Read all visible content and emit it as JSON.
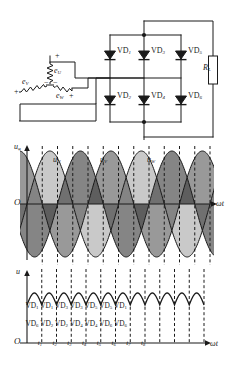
{
  "figure": {
    "type": "three-phase-bridge-rectifier-diagram",
    "colors": {
      "line": "#1a1a1a",
      "fill_light": "#a8a8a8",
      "fill_dark": "#5a5a5a",
      "fill_darkest": "#3a3a3a",
      "axis": "#1a1a1a",
      "dashed": "#1a1a1a",
      "background": "#ffffff"
    }
  },
  "circuit": {
    "name": "three-phase-bridge-rectifier",
    "source": {
      "label": "three-phase-y-source",
      "phases": [
        {
          "name": "phase-u",
          "label": "e",
          "sub": "U",
          "polarity_top": "+",
          "polarity_bottom": "−"
        },
        {
          "name": "phase-v",
          "label": "e",
          "sub": "V",
          "polarity_top": "+",
          "polarity_bottom": "−"
        },
        {
          "name": "phase-w",
          "label": "e",
          "sub": "W",
          "polarity_top": "+",
          "polarity_bottom": "−"
        }
      ]
    },
    "diodes_top": [
      {
        "label": "VD",
        "sub": "1"
      },
      {
        "label": "VD",
        "sub": "3"
      },
      {
        "label": "VD",
        "sub": "5"
      }
    ],
    "diodes_bottom": [
      {
        "label": "VD",
        "sub": "2"
      },
      {
        "label": "VD",
        "sub": "4"
      },
      {
        "label": "VD",
        "sub": "6"
      }
    ],
    "load": {
      "label": "R",
      "sub": "L"
    }
  },
  "chart_data": [
    {
      "type": "line",
      "name": "phase-voltage-waveforms",
      "title": "",
      "ylabel": "uφ",
      "ylabel_main": "u",
      "ylabel_sub": "φ",
      "xlabel": "ωt",
      "origin_label": "O",
      "grid": false,
      "legend_position": "inline-above-peaks",
      "x": [
        0,
        30,
        60,
        90,
        120,
        150,
        180,
        210,
        240,
        270,
        300,
        330,
        360,
        390,
        420,
        450,
        480,
        510,
        540,
        570,
        600,
        630,
        660,
        690,
        720
      ],
      "xlim": [
        0,
        720
      ],
      "ylim": [
        -1.15,
        1.15
      ],
      "series": [
        {
          "name": "u_U",
          "label": "u",
          "sub": "U",
          "phase_deg": 0,
          "values": [
            0,
            0.5,
            0.866,
            1,
            0.866,
            0.5,
            0,
            -0.5,
            -0.866,
            -1,
            -0.866,
            -0.5,
            0,
            0.5,
            0.866,
            1,
            0.866,
            0.5,
            0,
            -0.5,
            -0.866,
            -1,
            -0.866,
            -0.5,
            0
          ]
        },
        {
          "name": "u_V",
          "label": "u",
          "sub": "V",
          "phase_deg": -120,
          "values": [
            -0.866,
            -1,
            -0.866,
            -0.5,
            0,
            0.5,
            0.866,
            1,
            0.866,
            0.5,
            0,
            -0.5,
            -0.866,
            -1,
            -0.866,
            -0.5,
            0,
            0.5,
            0.866,
            1,
            0.866,
            0.5,
            0,
            -0.5,
            -0.866
          ]
        },
        {
          "name": "u_W",
          "label": "u",
          "sub": "W",
          "phase_deg": 120,
          "values": [
            0.866,
            0.5,
            0,
            -0.5,
            -0.866,
            -1,
            -0.866,
            -0.5,
            0,
            0.5,
            0.866,
            1,
            0.866,
            0.5,
            0,
            -0.5,
            -0.866,
            -1,
            -0.866,
            -0.5,
            0,
            0.5,
            0.866,
            1,
            0.866
          ]
        }
      ]
    },
    {
      "type": "line",
      "name": "rectified-output-voltage",
      "title": "",
      "ylabel": "u",
      "ylabel_main": "u",
      "ylabel_sub": "d",
      "xlabel": "ωt",
      "origin_label": "O",
      "grid": false,
      "description": "six-pulse rectified dc output with ripple",
      "xlim": [
        0,
        720
      ],
      "ylim": [
        0,
        1.15
      ],
      "ripple_min": 0.866,
      "ripple_max": 1.0,
      "pulses": 14,
      "time_markers": [
        {
          "label": "t",
          "sub": "1"
        },
        {
          "label": "t",
          "sub": "2"
        },
        {
          "label": "t",
          "sub": "3"
        },
        {
          "label": "t",
          "sub": "4"
        },
        {
          "label": "t",
          "sub": "5"
        },
        {
          "label": "t",
          "sub": "6"
        },
        {
          "label": "t",
          "sub": "7"
        },
        {
          "label": "t",
          "sub": "8"
        }
      ],
      "conduction_top": [
        {
          "label": "VD",
          "sub": "1"
        },
        {
          "label": "VD",
          "sub": "1"
        },
        {
          "label": "VD",
          "sub": "3"
        },
        {
          "label": "VD",
          "sub": "3"
        },
        {
          "label": "VD",
          "sub": "5"
        },
        {
          "label": "VD",
          "sub": "5"
        },
        {
          "label": "VD",
          "sub": "1"
        }
      ],
      "conduction_bottom": [
        {
          "label": "VD",
          "sub": "6"
        },
        {
          "label": "VD",
          "sub": "2"
        },
        {
          "label": "VD",
          "sub": "2"
        },
        {
          "label": "VD",
          "sub": "4"
        },
        {
          "label": "VD",
          "sub": "4"
        },
        {
          "label": "VD",
          "sub": "6"
        },
        {
          "label": "VD",
          "sub": "6"
        }
      ]
    }
  ]
}
